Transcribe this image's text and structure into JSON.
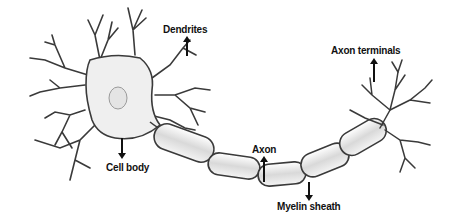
{
  "diagram": {
    "labels": [
      {
        "id": "dendrites",
        "text": "Dendrites",
        "arrow": "up"
      },
      {
        "id": "axon_terminals",
        "text": "Axon terminals",
        "arrow": "up"
      },
      {
        "id": "cell_body",
        "text": "Cell body",
        "arrow": "down"
      },
      {
        "id": "axon",
        "text": "Axon",
        "arrow": "up"
      },
      {
        "id": "myelin_sheath",
        "text": "Myelin sheath",
        "arrow": "down"
      }
    ],
    "colors": {
      "outline": "#3a3a3a",
      "fill": "#ececec",
      "highlight": "#d2d2d2",
      "text": "#111111",
      "background": "#ffffff"
    }
  }
}
